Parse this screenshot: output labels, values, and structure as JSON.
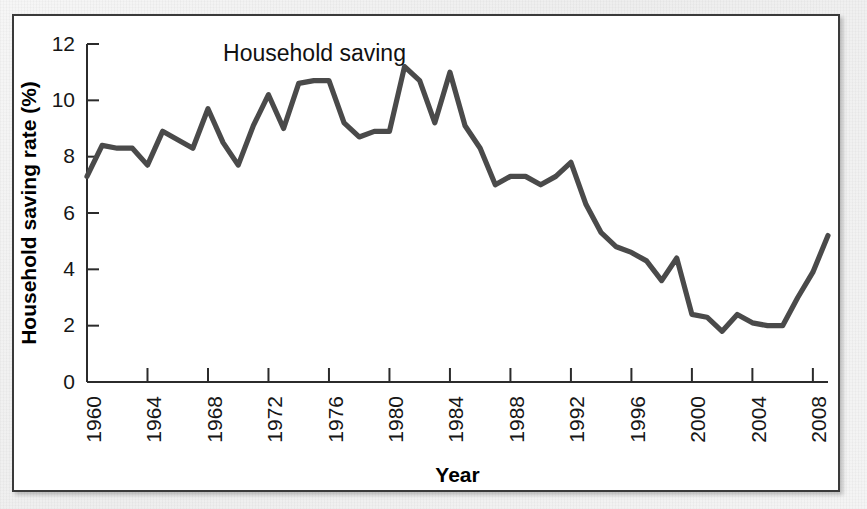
{
  "figure": {
    "panel_background": "#ffffff",
    "page_background": "#f2f2f2",
    "border_color": "#3a3a3a",
    "line_color": "#4a4a4a"
  },
  "chart_data": {
    "type": "line",
    "title": "",
    "subtitle": "",
    "xlabel": "Year",
    "ylabel": "Household saving rate (%)",
    "xlim": [
      1960,
      2009
    ],
    "ylim": [
      0,
      12
    ],
    "grid": false,
    "legend_position": "inline-annotation",
    "annotations": [
      {
        "text": "Household saving",
        "x": 1969,
        "y": 11.4
      }
    ],
    "x_ticks": [
      1960,
      1964,
      1968,
      1972,
      1976,
      1980,
      1984,
      1988,
      1992,
      1996,
      2000,
      2004,
      2008
    ],
    "x_tick_labels": [
      "1960",
      "1964",
      "1968",
      "1972",
      "1976",
      "1980",
      "1984",
      "1988",
      "1992",
      "1996",
      "2000",
      "2004",
      "2008"
    ],
    "y_ticks": [
      0,
      2,
      4,
      6,
      8,
      10,
      12
    ],
    "y_tick_labels": [
      "0",
      "2",
      "4",
      "6",
      "8",
      "10",
      "12"
    ],
    "series": [
      {
        "name": "Household saving",
        "x": [
          1960,
          1961,
          1962,
          1963,
          1964,
          1965,
          1966,
          1967,
          1968,
          1969,
          1970,
          1971,
          1972,
          1973,
          1974,
          1975,
          1976,
          1977,
          1978,
          1979,
          1980,
          1981,
          1982,
          1983,
          1984,
          1985,
          1986,
          1987,
          1988,
          1989,
          1990,
          1991,
          1992,
          1993,
          1994,
          1995,
          1996,
          1997,
          1998,
          1999,
          2000,
          2001,
          2002,
          2003,
          2004,
          2005,
          2006,
          2007,
          2008,
          2009
        ],
        "values": [
          7.3,
          8.4,
          8.3,
          8.3,
          7.7,
          8.9,
          8.6,
          8.3,
          9.7,
          8.5,
          7.7,
          9.1,
          10.2,
          9.0,
          10.6,
          10.7,
          10.7,
          9.2,
          8.7,
          8.9,
          8.9,
          11.2,
          10.7,
          9.2,
          11.0,
          9.1,
          8.3,
          7.0,
          7.3,
          7.3,
          7.0,
          7.3,
          7.8,
          6.3,
          5.3,
          4.8,
          4.6,
          4.3,
          3.6,
          4.4,
          2.4,
          2.3,
          1.8,
          2.4,
          2.1,
          2.0,
          2.0,
          3.0,
          3.9,
          5.2
        ]
      }
    ]
  }
}
